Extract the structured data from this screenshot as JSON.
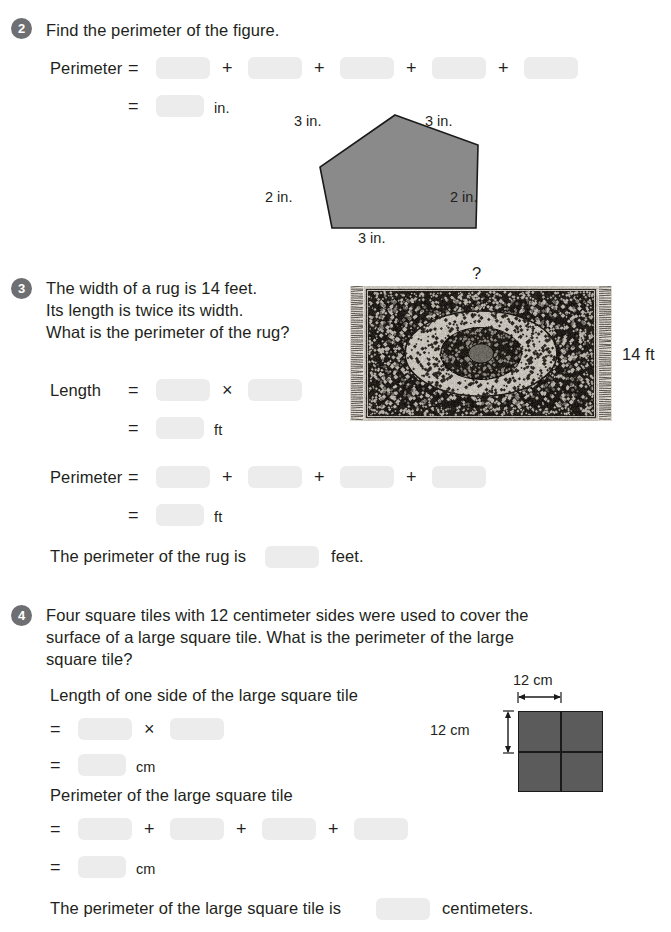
{
  "page": {
    "background": "#ffffff",
    "text_color": "#231f20",
    "blank_color": "#ececec",
    "badge_color": "#6e6f72",
    "figure_fill": "#8a8a8a",
    "tile_fill": "#5b5b5b"
  },
  "q2": {
    "number": "2",
    "prompt": "Find the perimeter of the figure.",
    "line1_label": "Perimeter",
    "line1_eq": "=",
    "line1_ops": [
      "+",
      "+",
      "+",
      "+"
    ],
    "line1_blanks": [
      "",
      "",
      "",
      "",
      ""
    ],
    "line2_eq": "=",
    "line2_blank": "",
    "line2_unit": "in.",
    "figure": {
      "type": "pentagon",
      "side_labels": {
        "top_left": "3 in.",
        "top_right": "3 in.",
        "left": "2 in.",
        "right": "2 in.",
        "bottom": "3 in."
      }
    }
  },
  "q3": {
    "number": "3",
    "prompt_lines": [
      "The width of a rug is 14 feet.",
      "Its length is twice its width.",
      "What is the perimeter of the rug?"
    ],
    "length_label": "Length",
    "length_eq": "=",
    "length_op": "×",
    "length_blanks": [
      "",
      ""
    ],
    "length_result_eq": "=",
    "length_result_blank": "",
    "length_unit": "ft",
    "perimeter_label": "Perimeter",
    "perimeter_eq": "=",
    "perimeter_ops": [
      "+",
      "+",
      "+"
    ],
    "perimeter_blanks": [
      "",
      "",
      "",
      ""
    ],
    "perimeter_result_eq": "=",
    "perimeter_result_blank": "",
    "perimeter_unit": "ft",
    "conclusion_prefix": "The perimeter of the rug is",
    "conclusion_blank": "",
    "conclusion_suffix": "feet.",
    "image": {
      "alt": "ornate persian rug",
      "top_label": "?",
      "side_label": "14 ft"
    }
  },
  "q4": {
    "number": "4",
    "prompt_lines": [
      "Four square tiles with 12 centimeter sides were used to cover the",
      "surface of a large square tile. What is the perimeter of the large",
      "square tile?"
    ],
    "side_heading": "Length of one side of the large square tile",
    "side_eq1": "=",
    "side_op": "×",
    "side_blanks": [
      "",
      ""
    ],
    "side_eq2": "=",
    "side_result_blank": "",
    "side_unit": "cm",
    "perimeter_heading": "Perimeter of the large square tile",
    "perimeter_eq1": "=",
    "perimeter_ops": [
      "+",
      "+",
      "+"
    ],
    "perimeter_blanks": [
      "",
      "",
      "",
      ""
    ],
    "perimeter_eq2": "=",
    "perimeter_result_blank": "",
    "perimeter_unit": "cm",
    "conclusion_prefix": "The perimeter of the large square tile is",
    "conclusion_blank": "",
    "conclusion_suffix": "centimeters.",
    "diagram": {
      "type": "four-square-tiles",
      "top_label": "12 cm",
      "left_label": "12 cm"
    }
  }
}
